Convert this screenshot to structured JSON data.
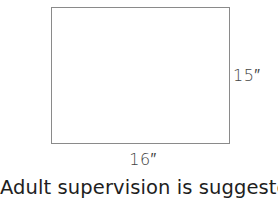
{
  "diagram": {
    "shape": "rectangle",
    "height_label": "15″",
    "width_label": "16″",
    "caption": "Adult supervision is suggested",
    "colors": {
      "outline": "#8a8a8a",
      "text": "#2a2a2a",
      "background": "#ffffff"
    }
  }
}
